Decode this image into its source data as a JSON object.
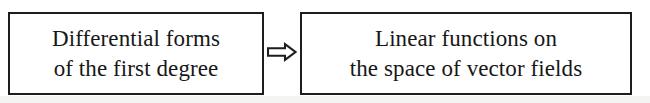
{
  "diagram": {
    "type": "implication-flow",
    "nodes": [
      {
        "id": "differential-forms",
        "lines": [
          "Differential forms",
          "of the first degree"
        ]
      },
      {
        "id": "linear-functions",
        "lines": [
          "Linear functions on",
          "the space of vector fields"
        ]
      }
    ],
    "connector": {
      "icon": "double-arrow-right-icon",
      "symbol": "⇒",
      "meaning": "implies"
    },
    "colors": {
      "stroke": "#1d1d1d",
      "text": "#171717",
      "background": "#ffffff"
    }
  }
}
